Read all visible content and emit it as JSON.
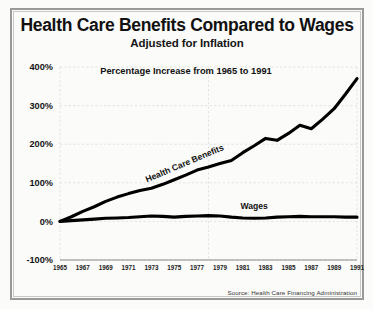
{
  "figure": {
    "title": "Health Care Benefits Compared to Wages",
    "subtitle": "Adjusted for Inflation",
    "annotation": "Percentage Increase from 1965 to 1991",
    "source": "Source: Health Care Financing Administration",
    "background_color": "#fbfbf9",
    "line_color": "#000000",
    "grid_color": "#d9d9d4",
    "frame_color": "#9a9a96"
  },
  "chart_data": {
    "type": "line",
    "title": "Health Care Benefits Compared to Wages",
    "subtitle": "Adjusted for Inflation",
    "annotation": "Percentage Increase from 1965 to 1991",
    "xlabel": "",
    "ylabel": "",
    "xlim": [
      1965,
      1991
    ],
    "ylim": [
      -100,
      400
    ],
    "ytick_labels": [
      "400%",
      "300%",
      "200%",
      "100%",
      "0%",
      "-100%"
    ],
    "ytick_values": [
      400,
      300,
      200,
      100,
      0,
      -100
    ],
    "xtick_labels": [
      "1965",
      "1967",
      "1969",
      "1971",
      "1973",
      "1975",
      "1977",
      "1979",
      "1981",
      "1983",
      "1985",
      "1987",
      "1989",
      "1991"
    ],
    "xtick_values": [
      1965,
      1967,
      1969,
      1971,
      1973,
      1975,
      1977,
      1979,
      1981,
      1983,
      1985,
      1987,
      1989,
      1991
    ],
    "grid": true,
    "legend": "inline-labels",
    "x": [
      1965,
      1966,
      1967,
      1968,
      1969,
      1970,
      1971,
      1972,
      1973,
      1974,
      1975,
      1976,
      1977,
      1978,
      1979,
      1980,
      1981,
      1982,
      1983,
      1984,
      1985,
      1986,
      1987,
      1988,
      1989,
      1990,
      1991
    ],
    "series": [
      {
        "name": "Health Care Benefits",
        "label": "Health Care Benefits",
        "color": "#000000",
        "values": [
          0,
          12,
          26,
          38,
          52,
          63,
          72,
          80,
          86,
          96,
          108,
          120,
          133,
          141,
          150,
          158,
          178,
          196,
          215,
          210,
          228,
          249,
          240,
          265,
          292,
          330,
          370
        ]
      },
      {
        "name": "Wages",
        "label": "Wages",
        "color": "#000000",
        "values": [
          0,
          2,
          4,
          6,
          8,
          9,
          10,
          12,
          14,
          13,
          11,
          13,
          14,
          15,
          14,
          11,
          9,
          8,
          9,
          11,
          12,
          13,
          12,
          12,
          12,
          11,
          11
        ]
      }
    ]
  }
}
